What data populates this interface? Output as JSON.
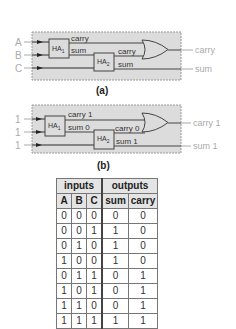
{
  "diagram_a": {
    "inputs": [
      "A",
      "B",
      "C"
    ],
    "ha1_label": "HA",
    "ha1_sub": "1",
    "ha2_label": "HA",
    "ha2_sub": "2",
    "ha1_carry_label": "carry",
    "ha1_sum_label": "sum",
    "ha2_carry_label": "carry",
    "ha2_sum_label": "sum",
    "out_carry": "carry",
    "out_sum": "sum",
    "caption": "(a)"
  },
  "diagram_b": {
    "inputs": [
      "1",
      "1",
      "1"
    ],
    "ha1_label": "HA",
    "ha1_sub": "1",
    "ha2_label": "HA",
    "ha2_sub": "2",
    "ha1_carry_label": "carry 1",
    "ha1_sum_label": "sum 0",
    "ha2_carry_label": "carry 0",
    "ha2_sum_label": "sum 1",
    "out_carry": "carry 1",
    "out_sum": "sum 1",
    "caption": "(b)"
  },
  "truth_table": {
    "group_headers": [
      "inputs",
      "outputs"
    ],
    "columns": [
      "A",
      "B",
      "C",
      "sum",
      "carry"
    ],
    "rows": [
      [
        "0",
        "0",
        "0",
        "0",
        "0"
      ],
      [
        "0",
        "0",
        "1",
        "1",
        "0"
      ],
      [
        "0",
        "1",
        "0",
        "1",
        "0"
      ],
      [
        "1",
        "0",
        "0",
        "1",
        "0"
      ],
      [
        "0",
        "1",
        "1",
        "0",
        "1"
      ],
      [
        "1",
        "0",
        "1",
        "0",
        "1"
      ],
      [
        "1",
        "1",
        "0",
        "0",
        "1"
      ],
      [
        "1",
        "1",
        "1",
        "1",
        "1"
      ]
    ]
  },
  "colors": {
    "box_fill": "#dcdcdc",
    "box_border": "#9a9a9a",
    "wire": "#444444",
    "external_label": "#aaaaaa",
    "internal_label": "#333333"
  }
}
